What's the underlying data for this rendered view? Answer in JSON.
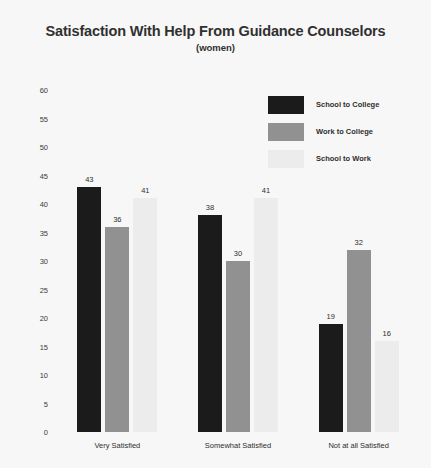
{
  "chart_data": {
    "type": "bar",
    "title": "Satisfaction With Help From Guidance Counselors",
    "subtitle": "(women)",
    "xlabel": "",
    "ylabel": "",
    "ylim": [
      0,
      60
    ],
    "ytick_step": 5,
    "grid": false,
    "legend_position": "upper right",
    "categories": [
      "Very Satisfied",
      "Somewhat Satisfied",
      "Not at all Satisfied"
    ],
    "ytick_labels": [
      "60",
      "55",
      "50",
      "45",
      "40",
      "35",
      "30",
      "25",
      "20",
      "15",
      "10",
      "5",
      "0"
    ],
    "series": [
      {
        "name": "School to College",
        "color": "#1b1b1b",
        "values": [
          43,
          38,
          19
        ]
      },
      {
        "name": "Work to College",
        "color": "#919191",
        "values": [
          36,
          30,
          32
        ]
      },
      {
        "name": "School to Work",
        "color": "#ececec",
        "values": [
          41,
          41,
          16
        ]
      }
    ]
  },
  "colors": {
    "background": "#f7f7f7",
    "text": "#2e2e2e",
    "title": "#303030"
  }
}
